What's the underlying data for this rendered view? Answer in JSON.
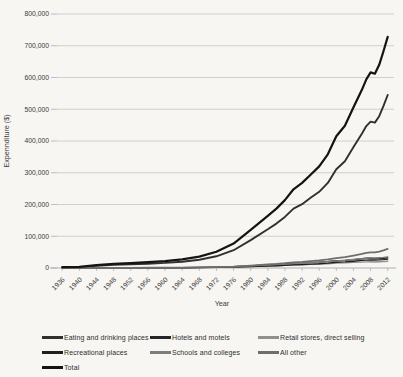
{
  "chart_data": {
    "type": "line",
    "title": "",
    "xlabel": "Year",
    "ylabel": "Expennditure ($)",
    "ylim": [
      0,
      800000
    ],
    "ytick_step": 100000,
    "grid": "horizontal",
    "legend_position": "bottom",
    "background": "#f7f6f2",
    "gridline_color": "#c6c6c6",
    "axis_line_color": "#aeaeae",
    "text_color": "#3b3b3b",
    "xticks": [
      1936,
      1940,
      1944,
      1948,
      1952,
      1956,
      1960,
      1964,
      1968,
      1972,
      1976,
      1980,
      1984,
      1988,
      1992,
      1996,
      2000,
      2004,
      2008,
      2012
    ],
    "x": [
      1936,
      1940,
      1944,
      1948,
      1952,
      1956,
      1960,
      1964,
      1968,
      1972,
      1976,
      1980,
      1984,
      1986,
      1988,
      1990,
      1992,
      1994,
      1996,
      1998,
      2000,
      2002,
      2004,
      2006,
      2007,
      2008,
      2009,
      2010,
      2011,
      2012
    ],
    "series": [
      {
        "name": "Eating and drinking places",
        "color": "#303030",
        "width": 1.9,
        "values": [
          2100,
          2700,
          6600,
          10000,
          11600,
          13600,
          16100,
          19800,
          26200,
          37000,
          56000,
          88000,
          122000,
          140000,
          161000,
          187000,
          201000,
          221000,
          240000,
          268000,
          311000,
          336000,
          381000,
          424000,
          447000,
          461000,
          458000,
          478000,
          510000,
          545000
        ]
      },
      {
        "name": "Hotels and  motels",
        "color": "#262626",
        "width": 1.4,
        "values": [
          180,
          230,
          450,
          600,
          700,
          850,
          1000,
          1300,
          1800,
          2600,
          4000,
          6500,
          9500,
          11000,
          12500,
          14500,
          15500,
          17000,
          18500,
          20500,
          23000,
          24000,
          26500,
          29000,
          30500,
          31000,
          29000,
          29500,
          30500,
          32000
        ]
      },
      {
        "name": "Retail stores, direct selling",
        "color": "#909090",
        "width": 1.4,
        "values": [
          120,
          150,
          300,
          420,
          500,
          600,
          750,
          950,
          1300,
          1900,
          2900,
          4500,
          6500,
          7400,
          8400,
          9700,
          10400,
          11400,
          12400,
          13700,
          15400,
          16200,
          17500,
          18700,
          19300,
          19600,
          19000,
          19400,
          20000,
          21000
        ]
      },
      {
        "name": "Recreational places",
        "color": "#1f1f1f",
        "width": 1.4,
        "values": [
          90,
          120,
          250,
          350,
          420,
          520,
          650,
          850,
          1200,
          1800,
          2800,
          4400,
          6400,
          7400,
          8600,
          10000,
          11000,
          12300,
          13600,
          15400,
          17800,
          19200,
          21500,
          23800,
          25000,
          25600,
          24800,
          25500,
          26500,
          28000
        ]
      },
      {
        "name": "Schools and colleges",
        "color": "#7d7d7d",
        "width": 1.4,
        "values": [
          160,
          210,
          420,
          580,
          700,
          860,
          1050,
          1350,
          1900,
          2800,
          4200,
          6600,
          9400,
          10700,
          12200,
          14000,
          15200,
          16600,
          18100,
          20000,
          22500,
          24200,
          27000,
          29700,
          31000,
          31800,
          31500,
          32300,
          33500,
          35000
        ]
      },
      {
        "name": "All other",
        "color": "#6e6e6e",
        "width": 1.7,
        "values": [
          150,
          190,
          380,
          550,
          680,
          830,
          1050,
          1400,
          2000,
          3000,
          4700,
          7600,
          11200,
          13000,
          15100,
          17800,
          19600,
          21800,
          24000,
          27000,
          31000,
          34000,
          39000,
          44500,
          47500,
          49500,
          49000,
          51500,
          55500,
          60000
        ]
      },
      {
        "name": "Total",
        "color": "#141414",
        "width": 2.2,
        "values": [
          2800,
          3600,
          8800,
          13200,
          15500,
          18300,
          21800,
          27000,
          36000,
          51000,
          77000,
          120000,
          164000,
          187000,
          214000,
          248000,
          268000,
          294000,
          320000,
          358000,
          415000,
          448000,
          506000,
          562000,
          594000,
          616000,
          612000,
          640000,
          682000,
          728000
        ]
      }
    ]
  }
}
